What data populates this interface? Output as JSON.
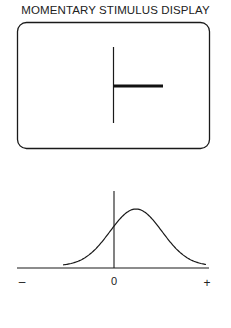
{
  "title": "MOMENTARY STIMULUS DISPLAY",
  "display": {
    "elements": [
      "vertical-reference-line",
      "horizontal-stimulus-bar"
    ]
  },
  "chart_data": {
    "type": "line",
    "title": "",
    "xlabel": "",
    "ylabel": "",
    "x_tick_labels": [
      "–",
      "0",
      "+"
    ],
    "x": [
      -1.0,
      -0.8,
      -0.6,
      -0.4,
      -0.2,
      0.0,
      0.2,
      0.4,
      0.6,
      0.8,
      1.0
    ],
    "y": [
      0.0,
      0.03,
      0.2,
      0.5,
      0.82,
      0.98,
      0.9,
      0.62,
      0.3,
      0.08,
      0.0
    ],
    "xlim": [
      -1.1,
      1.0
    ],
    "grid": false,
    "legend": "none"
  },
  "colors": {
    "ink": "#1a1a1a"
  }
}
